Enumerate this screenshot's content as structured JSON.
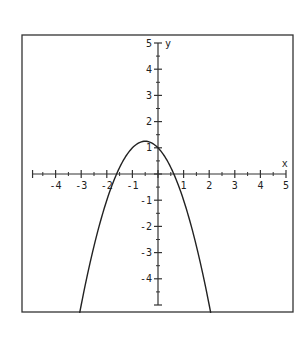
{
  "chart_data": {
    "type": "line",
    "title": "",
    "xlabel": "x",
    "ylabel": "y",
    "xlim": [
      -5,
      5
    ],
    "ylim": [
      -5,
      5
    ],
    "grid": false,
    "x_ticks": [
      -4,
      -3,
      -2,
      -1,
      1,
      2,
      3,
      4,
      5
    ],
    "y_ticks": [
      5,
      4,
      3,
      2,
      1,
      -1,
      -2,
      -3,
      -4
    ],
    "series": [
      {
        "name": "y = -x^2 - x + 1",
        "x": [
          -3,
          -2.5,
          -2,
          -1.5,
          -1,
          -0.5,
          0,
          0.5,
          1,
          1.5,
          2
        ],
        "values": [
          -5,
          -2.75,
          -1,
          0.25,
          1,
          1.25,
          1,
          0.25,
          -1,
          -2.75,
          -5
        ]
      }
    ],
    "annotations": {
      "vertex": [
        -0.5,
        1.25
      ],
      "y_intercept": 1,
      "x_intercepts": [
        -1.618,
        0.618
      ]
    }
  },
  "axes": {
    "x_label": "x",
    "y_label": "y",
    "x_tick_labels": [
      "-4",
      "-3",
      "-2",
      "-1",
      "1",
      "2",
      "3",
      "4",
      "5"
    ],
    "y_tick_labels": [
      "5",
      "4",
      "3",
      "2",
      "1",
      "-1",
      "-2",
      "-3",
      "-4"
    ]
  },
  "colors": {
    "line": "#222222",
    "frame": "#333333",
    "background": "#ffffff"
  }
}
